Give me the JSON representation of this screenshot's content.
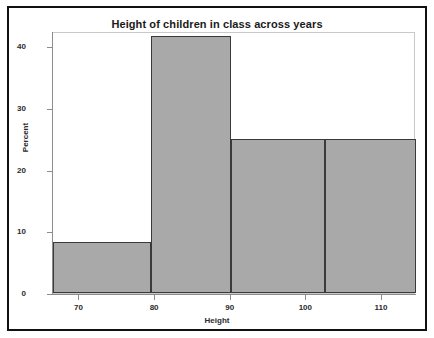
{
  "chart_data": {
    "type": "bar",
    "title": "Height of children in class across years",
    "xlabel": "Height",
    "ylabel": "Percent",
    "xlim": [
      66.5,
      114.5
    ],
    "ylim": [
      0,
      42.5
    ],
    "grid": false,
    "legend": null,
    "x_ticks": [
      70,
      80,
      90,
      100,
      110
    ],
    "x_tick_labels": [
      "70",
      "80",
      "90",
      "100",
      "110"
    ],
    "y_ticks": [
      0,
      10,
      20,
      30,
      40
    ],
    "y_tick_labels": [
      "0",
      "10",
      "20",
      "30",
      "40"
    ],
    "bar_fill_color": "#a9a9a9",
    "bar_edge_color": "#3a3a3a",
    "bins": [
      {
        "label": "66.5-79.5",
        "left": 66.5,
        "right": 79.5,
        "value": 8.3
      },
      {
        "label": "79.5-90",
        "left": 79.5,
        "right": 90,
        "value": 41.7
      },
      {
        "label": "90-102.5",
        "left": 90,
        "right": 102.5,
        "value": 25
      },
      {
        "label": "102.5-114.5",
        "left": 102.5,
        "right": 114.5,
        "value": 25
      }
    ],
    "categories": [
      "66.5-79.5",
      "79.5-90",
      "90-102.5",
      "102.5-114.5"
    ],
    "values": [
      8.3,
      41.7,
      25,
      25
    ]
  }
}
